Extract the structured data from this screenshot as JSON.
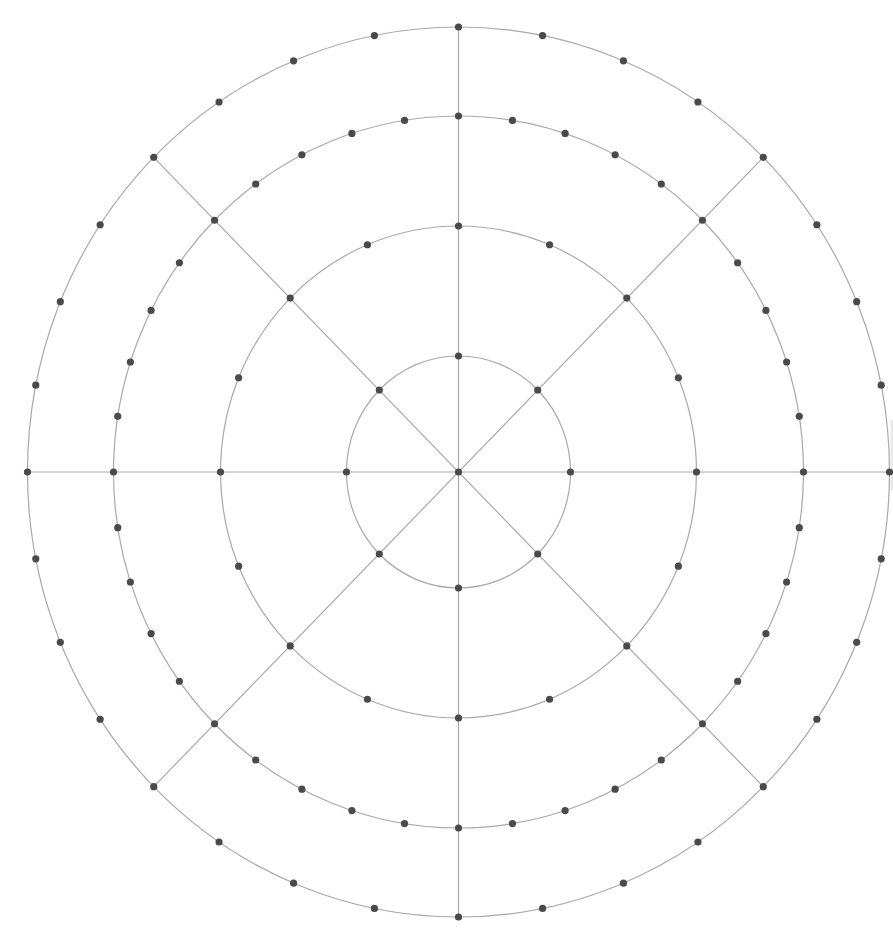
{
  "diagram": {
    "type": "polar-grid",
    "center": {
      "x": 458.5,
      "y": 472
    },
    "colors": {
      "line": "#a9a9a9",
      "node": "#4a4a4a",
      "background": "#ffffff"
    },
    "node_radius": 3.6,
    "rings": [
      {
        "name": "ring-1",
        "rx": 112,
        "ry": 116,
        "node_count": 8
      },
      {
        "name": "ring-2",
        "rx": 238,
        "ry": 246,
        "node_count": 16
      },
      {
        "name": "ring-3",
        "rx": 345,
        "ry": 356,
        "node_count": 40
      },
      {
        "name": "ring-4",
        "rx": 431,
        "ry": 445,
        "node_count": 32
      }
    ],
    "spokes": [
      {
        "name": "spoke-horizontal",
        "angle_deg": 0,
        "full": true
      },
      {
        "name": "spoke-vertical",
        "angle_deg": 90,
        "full": true
      },
      {
        "name": "spoke-diagonal-ne-sw",
        "angle_deg": 45,
        "full": true
      },
      {
        "name": "spoke-diagonal-nw-se",
        "angle_deg": 135,
        "full": true
      }
    ],
    "center_node": true
  }
}
